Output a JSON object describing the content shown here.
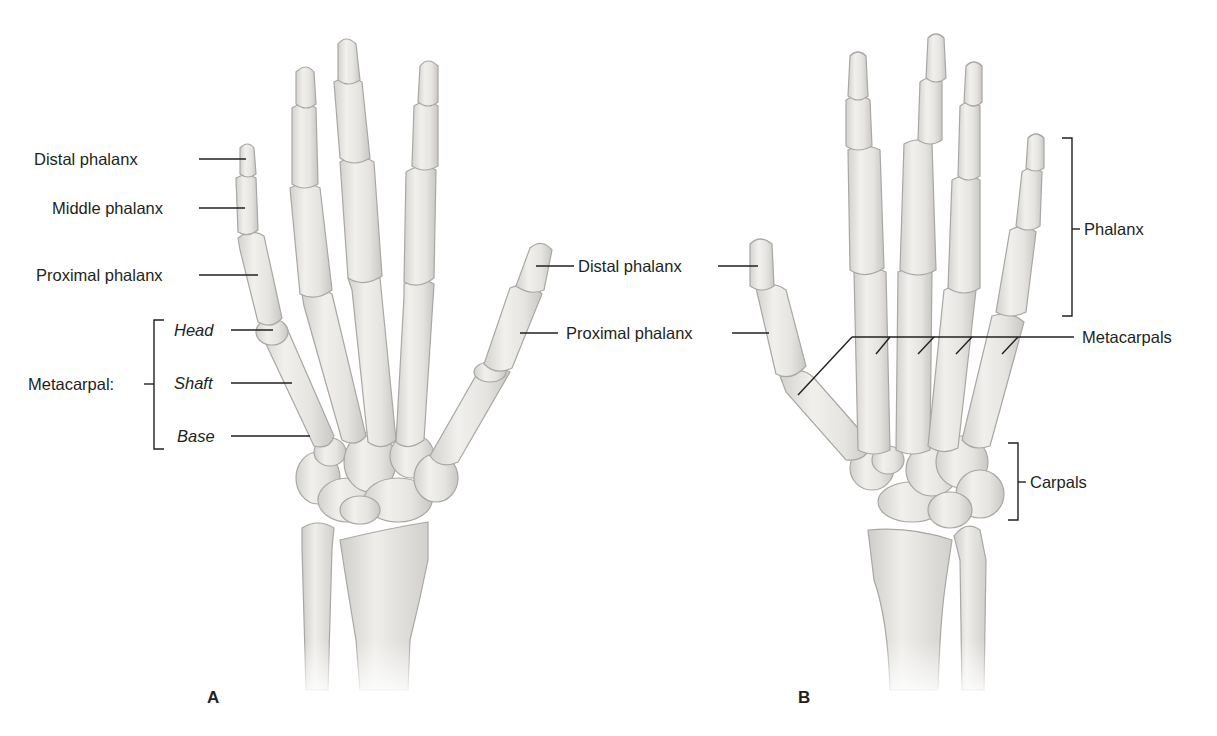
{
  "figure": {
    "panels": [
      {
        "id": "A",
        "label": "A",
        "view": "hand skeleton, left panel",
        "labels": {
          "distal_phalanx_finger": "Distal phalanx",
          "middle_phalanx": "Middle phalanx",
          "proximal_phalanx_finger": "Proximal phalanx",
          "metacarpal_group": "Metacarpal:",
          "head": "Head",
          "shaft": "Shaft",
          "base": "Base",
          "distal_phalanx_thumb": "Distal phalanx",
          "proximal_phalanx_thumb": "Proximal phalanx"
        }
      },
      {
        "id": "B",
        "label": "B",
        "view": "hand skeleton, right panel",
        "labels": {
          "distal_phalanx_thumb": "Distal phalanx",
          "proximal_phalanx_thumb": "Proximal phalanx",
          "phalanx_group": "Phalanx",
          "metacarpals": "Metacarpals",
          "carpals": "Carpals"
        }
      }
    ],
    "colors": {
      "bone_fill": "#ecebe8",
      "bone_stroke": "#a9a7a3",
      "bone_shadow": "#cfcdc9",
      "leader_line": "#231f20",
      "text": "#231f20",
      "background": "#ffffff"
    }
  }
}
